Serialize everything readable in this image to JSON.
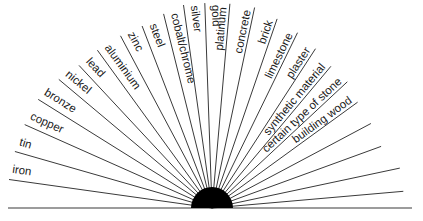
{
  "diagram": {
    "colors": {
      "line": "#3a3a3a",
      "hub": "#000000",
      "text": "#1a1a1a",
      "background": "#ffffff"
    },
    "hub": {
      "cx": 212,
      "cy": 208,
      "r": 21
    },
    "baseline": {
      "x1": 8,
      "x2": 412,
      "y": 208
    },
    "rays": [
      {
        "angle": 172,
        "length": 205,
        "label": "iron"
      },
      {
        "angle": 164,
        "length": 205,
        "label": "tin"
      },
      {
        "angle": 156,
        "length": 205,
        "label": "copper"
      },
      {
        "angle": 148,
        "length": 205,
        "label": "bronze"
      },
      {
        "angle": 140,
        "length": 200,
        "label": "nickel"
      },
      {
        "angle": 133,
        "length": 195,
        "label": "lead"
      },
      {
        "angle": 126,
        "length": 195,
        "label": "aluminium"
      },
      {
        "angle": 118,
        "length": 195,
        "label": "zinc"
      },
      {
        "angle": 111,
        "length": 195,
        "label": "steel"
      },
      {
        "angle": 104,
        "length": 200,
        "label": "cobalt/chrome"
      },
      {
        "angle": 98,
        "length": 205,
        "label": "silver"
      },
      {
        "angle": 92,
        "length": 205,
        "label": "gold"
      },
      {
        "angle": 85,
        "length": 205,
        "label": "platinum"
      },
      {
        "angle": 78,
        "length": 205,
        "label": "concrete"
      },
      {
        "angle": 71,
        "length": 200,
        "label": "brick"
      },
      {
        "angle": 64,
        "length": 195,
        "label": "limestone"
      },
      {
        "angle": 57,
        "length": 190,
        "label": "plaster"
      },
      {
        "angle": 50,
        "length": 185,
        "label": "synthetic material"
      },
      {
        "angle": 43,
        "length": 185,
        "label": "certain type of stone"
      },
      {
        "angle": 36,
        "length": 180,
        "label": "building wood"
      },
      {
        "angle": 28,
        "length": 180,
        "label": ""
      },
      {
        "angle": 20,
        "length": 180,
        "label": ""
      },
      {
        "angle": 12,
        "length": 192,
        "label": ""
      },
      {
        "angle": 5,
        "length": 192,
        "label": ""
      }
    ]
  }
}
